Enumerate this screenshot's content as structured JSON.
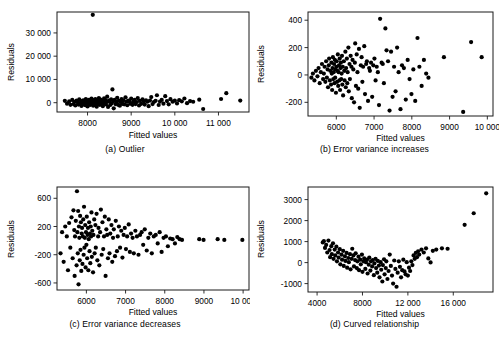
{
  "figure": {
    "panel_count": 4,
    "shared_xlabel": "Fitted values",
    "shared_ylabel": "Residuals"
  },
  "chart_data": [
    {
      "type": "scatter",
      "panel": "a",
      "caption": "(a) Outlier",
      "title": "",
      "xlabel": "Fitted values",
      "ylabel": "Residuals",
      "xlim": [
        7300,
        11700
      ],
      "ylim": [
        -4000,
        39000
      ],
      "xticks": [
        8000,
        9000,
        10000,
        11000
      ],
      "xticklabels": [
        "8000",
        "9000",
        "10 000",
        "11 000"
      ],
      "yticks": [
        0,
        10000,
        20000,
        30000
      ],
      "yticklabels": [
        "0",
        "10 000",
        "20 000",
        "30 000"
      ],
      "grid": false,
      "legend": "none",
      "marker_color": "#000000",
      "x": [
        8120,
        7480,
        7530,
        7580,
        7610,
        7650,
        7680,
        7700,
        7720,
        7750,
        7770,
        7790,
        7810,
        7830,
        7850,
        7860,
        7880,
        7900,
        7910,
        7930,
        7950,
        7960,
        7980,
        7990,
        8000,
        8010,
        8030,
        8040,
        8050,
        8060,
        8080,
        8090,
        8100,
        8110,
        8130,
        8140,
        8150,
        8160,
        8180,
        8190,
        8200,
        8210,
        8230,
        8240,
        8250,
        8260,
        8280,
        8290,
        8300,
        8320,
        8330,
        8350,
        8360,
        8380,
        8390,
        8410,
        8420,
        8440,
        8450,
        8470,
        8490,
        8500,
        8520,
        8540,
        8550,
        8570,
        8590,
        8600,
        8620,
        8640,
        8660,
        8680,
        8700,
        8720,
        8740,
        8760,
        8780,
        8800,
        8820,
        8840,
        8870,
        8890,
        8910,
        8930,
        8960,
        8980,
        9000,
        9030,
        9050,
        9080,
        9100,
        9130,
        9150,
        9180,
        9200,
        9230,
        9260,
        9290,
        9310,
        9340,
        9370,
        9400,
        9430,
        9460,
        9490,
        9520,
        9560,
        9590,
        9630,
        9660,
        9700,
        9740,
        9780,
        9820,
        9860,
        9900,
        9950,
        10000,
        10050,
        10100,
        10160,
        10220,
        10280,
        10350,
        10420,
        10560,
        10650,
        11060,
        11180,
        11500
      ],
      "y": [
        37800,
        800,
        -400,
        600,
        -900,
        1200,
        -600,
        400,
        -1200,
        900,
        200,
        -800,
        1400,
        -300,
        700,
        -1400,
        500,
        1000,
        -700,
        300,
        -1100,
        1600,
        -200,
        800,
        -1600,
        400,
        1200,
        -500,
        900,
        -1000,
        600,
        1800,
        -300,
        200,
        -1300,
        1100,
        500,
        -800,
        1500,
        -400,
        700,
        -1700,
        300,
        1000,
        -600,
        2000,
        -900,
        400,
        1300,
        -200,
        800,
        -1500,
        600,
        1900,
        -400,
        1100,
        -700,
        300,
        2600,
        -1800,
        900,
        500,
        -1000,
        1400,
        -300,
        5700,
        700,
        -2400,
        1200,
        -600,
        400,
        2100,
        -900,
        800,
        -1300,
        300,
        1600,
        -500,
        1000,
        -700,
        2300,
        400,
        -1100,
        900,
        600,
        -400,
        1800,
        -900,
        500,
        1200,
        -600,
        300,
        2000,
        -1200,
        800,
        -500,
        1400,
        600,
        -800,
        1000,
        400,
        -1500,
        900,
        2400,
        -600,
        300,
        800,
        3200,
        -1000,
        500,
        1200,
        -400,
        2800,
        700,
        -700,
        1500,
        400,
        900,
        -300,
        1100,
        600,
        1800,
        -200,
        700,
        400,
        1300,
        -2700,
        1600,
        4100,
        900
      ]
    },
    {
      "type": "scatter",
      "panel": "b",
      "caption": "(b) Error variance increases",
      "title": "",
      "xlabel": "Fitted values",
      "ylabel": "Residuals",
      "xlim": [
        5250,
        10150
      ],
      "ylim": [
        -300,
        460
      ],
      "xticks": [
        6000,
        7000,
        8000,
        9000,
        10000
      ],
      "xticklabels": [
        "6000",
        "7000",
        "8000",
        "9000",
        "10 000"
      ],
      "yticks": [
        -200,
        0,
        200,
        400
      ],
      "yticklabels": [
        "-200",
        "0",
        "200",
        "400"
      ],
      "grid": false,
      "legend": "none",
      "marker_color": "#000000",
      "x": [
        5340,
        5380,
        5420,
        5460,
        5500,
        5530,
        5560,
        5590,
        5620,
        5650,
        5670,
        5690,
        5710,
        5730,
        5750,
        5770,
        5780,
        5800,
        5810,
        5830,
        5840,
        5860,
        5870,
        5880,
        5890,
        5900,
        5910,
        5920,
        5930,
        5940,
        5950,
        5960,
        5970,
        5980,
        5990,
        6000,
        6010,
        6020,
        6030,
        6040,
        6050,
        6060,
        6070,
        6080,
        6090,
        6100,
        6110,
        6120,
        6130,
        6140,
        6150,
        6160,
        6170,
        6180,
        6200,
        6210,
        6220,
        6240,
        6250,
        6260,
        6280,
        6290,
        6300,
        6320,
        6330,
        6350,
        6360,
        6380,
        6400,
        6410,
        6430,
        6450,
        6470,
        6490,
        6500,
        6520,
        6540,
        6560,
        6580,
        6600,
        6620,
        6650,
        6670,
        6690,
        6710,
        6740,
        6760,
        6790,
        6810,
        6840,
        6870,
        6890,
        6920,
        6950,
        6980,
        7010,
        7040,
        7070,
        7100,
        7130,
        7160,
        7200,
        7230,
        7260,
        7300,
        7330,
        7370,
        7410,
        7450,
        7490,
        7530,
        7570,
        7610,
        7650,
        7700,
        7740,
        7790,
        7840,
        7890,
        7940,
        7990,
        8040,
        8090,
        8150,
        8200,
        8260,
        8320,
        8380,
        8440,
        8850,
        9360,
        9570,
        9850
      ],
      "y": [
        -20,
        10,
        -40,
        30,
        -10,
        50,
        -60,
        20,
        80,
        -30,
        10,
        60,
        -50,
        100,
        -20,
        40,
        -90,
        70,
        120,
        -40,
        30,
        -70,
        90,
        10,
        -110,
        50,
        130,
        -30,
        20,
        80,
        -60,
        110,
        -20,
        40,
        -130,
        60,
        100,
        -50,
        30,
        150,
        -80,
        20,
        70,
        -40,
        120,
        -110,
        50,
        90,
        -30,
        10,
        140,
        -70,
        60,
        -150,
        100,
        30,
        -40,
        170,
        -90,
        50,
        120,
        -60,
        20,
        200,
        -120,
        80,
        -30,
        140,
        60,
        -170,
        110,
        40,
        -200,
        90,
        230,
        -80,
        150,
        20,
        -100,
        190,
        -240,
        70,
        130,
        -50,
        60,
        210,
        -140,
        80,
        100,
        -190,
        50,
        30,
        90,
        -160,
        70,
        120,
        -40,
        60,
        20,
        -220,
        410,
        90,
        80,
        -60,
        340,
        180,
        100,
        -260,
        170,
        -160,
        60,
        -120,
        200,
        20,
        -250,
        70,
        50,
        -180,
        110,
        -30,
        -140,
        40,
        -190,
        270,
        60,
        -80,
        110,
        10,
        -20,
        130,
        -270,
        240,
        130
      ]
    },
    {
      "type": "scatter",
      "panel": "c",
      "caption": "(c) Error variance decreases",
      "title": "",
      "xlabel": "Fitted values",
      "ylabel": "Residuals",
      "xlim": [
        5250,
        10150
      ],
      "ylim": [
        -700,
        760
      ],
      "xticks": [
        6000,
        7000,
        8000,
        9000,
        10000
      ],
      "xticklabels": [
        "6000",
        "7000",
        "8000",
        "9000",
        "10 000"
      ],
      "yticks": [
        -600,
        -200,
        200,
        600
      ],
      "yticklabels": [
        "-600",
        "-200",
        "200",
        "600"
      ],
      "grid": false,
      "legend": "none",
      "marker_color": "#000000",
      "x": [
        5340,
        5380,
        5420,
        5460,
        5500,
        5530,
        5560,
        5590,
        5620,
        5650,
        5670,
        5690,
        5700,
        5710,
        5730,
        5750,
        5760,
        5770,
        5780,
        5790,
        5800,
        5810,
        5820,
        5830,
        5840,
        5850,
        5860,
        5870,
        5880,
        5890,
        5900,
        5910,
        5920,
        5930,
        5940,
        5950,
        5960,
        5970,
        5980,
        5990,
        6000,
        6010,
        6020,
        6030,
        6040,
        6050,
        6060,
        6070,
        6080,
        6090,
        6100,
        6110,
        6120,
        6130,
        6140,
        6150,
        6170,
        6180,
        6200,
        6210,
        6230,
        6240,
        6260,
        6280,
        6300,
        6310,
        6330,
        6350,
        6370,
        6390,
        6410,
        6430,
        6450,
        6470,
        6490,
        6510,
        6530,
        6550,
        6570,
        6590,
        6610,
        6640,
        6660,
        6680,
        6700,
        6730,
        6750,
        6780,
        6800,
        6830,
        6860,
        6890,
        6920,
        6950,
        6980,
        7010,
        7040,
        7080,
        7110,
        7140,
        7180,
        7210,
        7250,
        7290,
        7330,
        7370,
        7410,
        7450,
        7490,
        7540,
        7580,
        7630,
        7670,
        7720,
        7770,
        7820,
        7870,
        7920,
        7970,
        8030,
        8080,
        8140,
        8200,
        8260,
        8320,
        8380,
        8440,
        8880,
        8990,
        9350,
        9520,
        9980
      ],
      "y": [
        -180,
        120,
        -300,
        200,
        60,
        -420,
        250,
        -100,
        330,
        -250,
        430,
        150,
        -500,
        60,
        280,
        -350,
        700,
        120,
        -180,
        420,
        -620,
        200,
        40,
        -280,
        350,
        -130,
        260,
        -430,
        100,
        180,
        -330,
        60,
        300,
        -200,
        480,
        -100,
        40,
        220,
        -380,
        120,
        -60,
        340,
        -250,
        80,
        180,
        -420,
        20,
        260,
        -150,
        100,
        -320,
        200,
        60,
        400,
        -230,
        140,
        -450,
        80,
        300,
        -180,
        220,
        -100,
        380,
        -280,
        60,
        180,
        -350,
        120,
        440,
        -200,
        260,
        -120,
        60,
        340,
        -500,
        160,
        80,
        -250,
        300,
        -180,
        100,
        220,
        -300,
        40,
        160,
        -220,
        280,
        -150,
        60,
        200,
        -100,
        140,
        -240,
        80,
        180,
        -120,
        60,
        230,
        -160,
        100,
        40,
        -180,
        140,
        60,
        -200,
        80,
        120,
        -60,
        160,
        -140,
        40,
        100,
        -180,
        60,
        80,
        -40,
        120,
        -160,
        40,
        60,
        -80,
        30,
        20,
        -40,
        50,
        20,
        10,
        20,
        10,
        20,
        10,
        10
      ]
    },
    {
      "type": "scatter",
      "panel": "d",
      "caption": "(d) Curved relationship",
      "title": "",
      "xlabel": "Fitted values",
      "ylabel": "Residuals",
      "xlim": [
        3200,
        19500
      ],
      "ylim": [
        -1400,
        3600
      ],
      "xticks": [
        4000,
        8000,
        12000,
        16000
      ],
      "xticklabels": [
        "4000",
        "8000",
        "12 000",
        "16 000"
      ],
      "yticks": [
        -1000,
        0,
        1000,
        2000,
        3000
      ],
      "yticklabels": [
        "-1000",
        "0",
        "1000",
        "2000",
        "3000"
      ],
      "grid": false,
      "legend": "none",
      "marker_color": "#000000",
      "x": [
        4500,
        4600,
        4700,
        4800,
        4900,
        5000,
        5100,
        5150,
        5250,
        5300,
        5400,
        5450,
        5550,
        5600,
        5700,
        5750,
        5850,
        5900,
        6000,
        6050,
        6150,
        6200,
        6300,
        6350,
        6450,
        6500,
        6600,
        6650,
        6750,
        6800,
        6900,
        6950,
        7050,
        7100,
        7200,
        7250,
        7350,
        7400,
        7500,
        7550,
        7650,
        7700,
        7800,
        7850,
        7950,
        8000,
        8100,
        8150,
        8250,
        8300,
        8400,
        8450,
        8550,
        8600,
        8700,
        8750,
        8850,
        8900,
        9000,
        9050,
        9150,
        9200,
        9300,
        9350,
        9450,
        9500,
        9600,
        9650,
        9750,
        9800,
        9900,
        9950,
        10050,
        10100,
        10200,
        10300,
        10400,
        10500,
        10600,
        10700,
        10800,
        10900,
        11000,
        11100,
        11200,
        11300,
        11400,
        11500,
        11600,
        11700,
        11800,
        11900,
        12000,
        12100,
        12200,
        12300,
        12400,
        12500,
        12600,
        12700,
        12800,
        12900,
        13000,
        13200,
        13400,
        13600,
        13800,
        14000,
        14200,
        14500,
        15000,
        15500,
        17000,
        17800,
        18900
      ],
      "y": [
        960,
        1020,
        700,
        840,
        480,
        1050,
        600,
        260,
        780,
        400,
        920,
        180,
        620,
        340,
        760,
        60,
        480,
        240,
        640,
        -80,
        380,
        140,
        560,
        -160,
        300,
        80,
        460,
        -240,
        220,
        20,
        400,
        -320,
        180,
        660,
        340,
        -180,
        120,
        440,
        -260,
        60,
        280,
        -360,
        140,
        -80,
        380,
        -440,
        60,
        200,
        -300,
        20,
        140,
        -520,
        -100,
        240,
        -380,
        60,
        -180,
        120,
        -600,
        -40,
        180,
        -260,
        -480,
        80,
        -140,
        -700,
        20,
        -340,
        -900,
        -120,
        160,
        -560,
        -260,
        60,
        -780,
        -400,
        380,
        -160,
        -620,
        -1000,
        100,
        -300,
        -1150,
        -480,
        60,
        -200,
        -700,
        -360,
        140,
        -420,
        -560,
        20,
        -620,
        -240,
        -400,
        60,
        -120,
        340,
        180,
        460,
        260,
        540,
        380,
        620,
        480,
        680,
        200,
        10,
        560,
        620,
        680,
        660,
        1800,
        2350,
        3300
      ]
    }
  ]
}
